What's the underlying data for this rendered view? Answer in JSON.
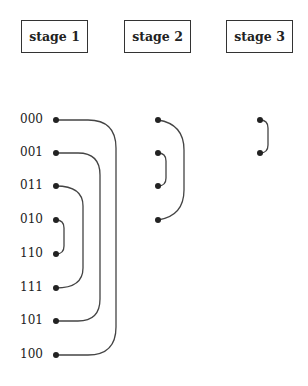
{
  "stages": [
    {
      "label": "stage 1"
    },
    {
      "label": "stage 2"
    },
    {
      "label": "stage 3"
    }
  ],
  "inputs": [
    "000",
    "001",
    "011",
    "010",
    "110",
    "111",
    "101",
    "100"
  ],
  "connections": {
    "stage_1": [
      [
        "000",
        "100"
      ],
      [
        "001",
        "101"
      ],
      [
        "011",
        "111"
      ],
      [
        "010",
        "110"
      ]
    ],
    "stage_2": [
      [
        0,
        3
      ],
      [
        1,
        2
      ]
    ],
    "stage_3": [
      [
        0,
        1
      ]
    ]
  },
  "colors": {
    "line": "#444444",
    "dot": "#222222",
    "border": "#333333"
  }
}
